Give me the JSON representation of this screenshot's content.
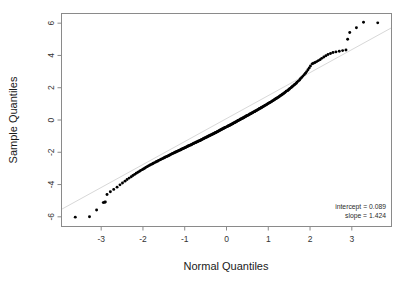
{
  "chart_data": {
    "type": "scatter",
    "title": "",
    "xlabel": "Normal Quantiles",
    "ylabel": "Sample Quantiles",
    "xlim": [
      -3.95,
      3.95
    ],
    "ylim": [
      -6.6,
      6.6
    ],
    "xticks": [
      -3,
      -2,
      -1,
      0,
      1,
      2,
      3
    ],
    "xtick_labels": [
      "-3",
      "-2",
      "-1",
      "0",
      "1",
      "2",
      "3"
    ],
    "yticks": [
      -6,
      -4,
      -2,
      0,
      2,
      4,
      6
    ],
    "ytick_labels": [
      "-6",
      "-4",
      "-2",
      "0",
      "2",
      "4",
      "6"
    ],
    "grid": false,
    "legend": "none",
    "point_color": "#000000",
    "reference_line": {
      "label": "qq reference line",
      "color": "#d8d8d8",
      "intercept": 0.089,
      "slope": 1.424
    },
    "annotations": [
      "intercept = 0.089",
      "slope = 1.424"
    ],
    "x": [
      -3.62,
      -3.28,
      -3.11,
      -2.95,
      -2.92,
      -2.9,
      -2.86,
      -2.78,
      -2.7,
      -2.62,
      -2.55,
      -2.49,
      -2.43,
      -2.38,
      -2.33,
      -2.28,
      -2.24,
      -2.2,
      -2.16,
      -2.12,
      -2.08,
      -2.05,
      -2.01,
      -1.98,
      -1.95,
      -1.92,
      -1.89,
      -1.86,
      -1.83,
      -1.8,
      -1.77,
      -1.75,
      -1.72,
      -1.69,
      -1.67,
      -1.64,
      -1.62,
      -1.59,
      -1.57,
      -1.55,
      -1.52,
      -1.5,
      -1.48,
      -1.46,
      -1.43,
      -1.41,
      -1.39,
      -1.37,
      -1.35,
      -1.33,
      -1.31,
      -1.29,
      -1.27,
      -1.25,
      -1.23,
      -1.21,
      -1.19,
      -1.17,
      -1.15,
      -1.13,
      -1.11,
      -1.09,
      -1.08,
      -1.06,
      -1.04,
      -1.02,
      -1.0,
      -0.98,
      -0.97,
      -0.95,
      -0.93,
      -0.91,
      -0.9,
      -0.88,
      -0.86,
      -0.84,
      -0.83,
      -0.81,
      -0.79,
      -0.78,
      -0.76,
      -0.74,
      -0.73,
      -0.71,
      -0.69,
      -0.68,
      -0.66,
      -0.64,
      -0.63,
      -0.61,
      -0.6,
      -0.58,
      -0.56,
      -0.55,
      -0.53,
      -0.52,
      -0.5,
      -0.48,
      -0.47,
      -0.45,
      -0.44,
      -0.42,
      -0.41,
      -0.39,
      -0.38,
      -0.36,
      -0.34,
      -0.33,
      -0.31,
      -0.3,
      -0.28,
      -0.27,
      -0.25,
      -0.24,
      -0.22,
      -0.21,
      -0.19,
      -0.18,
      -0.16,
      -0.15,
      -0.13,
      -0.12,
      -0.1,
      -0.09,
      -0.07,
      -0.06,
      -0.04,
      -0.03,
      -0.01,
      0.01,
      0.03,
      0.04,
      0.06,
      0.07,
      0.09,
      0.1,
      0.12,
      0.13,
      0.15,
      0.16,
      0.18,
      0.19,
      0.21,
      0.22,
      0.24,
      0.25,
      0.27,
      0.28,
      0.3,
      0.31,
      0.33,
      0.34,
      0.36,
      0.38,
      0.39,
      0.41,
      0.42,
      0.44,
      0.45,
      0.47,
      0.48,
      0.5,
      0.52,
      0.53,
      0.55,
      0.56,
      0.58,
      0.6,
      0.61,
      0.63,
      0.64,
      0.66,
      0.68,
      0.69,
      0.71,
      0.73,
      0.74,
      0.76,
      0.78,
      0.79,
      0.81,
      0.83,
      0.84,
      0.86,
      0.88,
      0.9,
      0.91,
      0.93,
      0.95,
      0.97,
      0.98,
      1.0,
      1.02,
      1.04,
      1.06,
      1.08,
      1.09,
      1.11,
      1.13,
      1.15,
      1.17,
      1.19,
      1.21,
      1.23,
      1.25,
      1.27,
      1.29,
      1.31,
      1.33,
      1.35,
      1.37,
      1.39,
      1.41,
      1.43,
      1.46,
      1.48,
      1.5,
      1.52,
      1.55,
      1.57,
      1.59,
      1.62,
      1.64,
      1.67,
      1.69,
      1.72,
      1.75,
      1.77,
      1.8,
      1.83,
      1.86,
      1.89,
      1.92,
      1.95,
      1.98,
      2.01,
      2.05,
      2.08,
      2.12,
      2.16,
      2.2,
      2.24,
      2.28,
      2.33,
      2.38,
      2.43,
      2.49,
      2.55,
      2.62,
      2.7,
      2.78,
      2.86,
      2.9,
      2.95,
      3.11,
      3.28,
      3.62
    ],
    "y": [
      -6.02,
      -6.0,
      -5.58,
      -5.12,
      -5.1,
      -5.08,
      -4.62,
      -4.45,
      -4.3,
      -4.16,
      -4.02,
      -3.9,
      -3.79,
      -3.69,
      -3.6,
      -3.52,
      -3.44,
      -3.37,
      -3.3,
      -3.24,
      -3.18,
      -3.12,
      -3.07,
      -3.02,
      -2.97,
      -2.92,
      -2.88,
      -2.83,
      -2.79,
      -2.75,
      -2.71,
      -2.68,
      -2.64,
      -2.6,
      -2.57,
      -2.54,
      -2.5,
      -2.47,
      -2.44,
      -2.41,
      -2.38,
      -2.35,
      -2.32,
      -2.29,
      -2.26,
      -2.24,
      -2.21,
      -2.18,
      -2.16,
      -2.13,
      -2.1,
      -2.08,
      -2.05,
      -2.03,
      -2.0,
      -1.98,
      -1.95,
      -1.93,
      -1.91,
      -1.88,
      -1.86,
      -1.84,
      -1.81,
      -1.79,
      -1.77,
      -1.75,
      -1.72,
      -1.7,
      -1.68,
      -1.66,
      -1.63,
      -1.61,
      -1.59,
      -1.57,
      -1.55,
      -1.53,
      -1.51,
      -1.48,
      -1.46,
      -1.44,
      -1.42,
      -1.4,
      -1.38,
      -1.36,
      -1.34,
      -1.32,
      -1.3,
      -1.28,
      -1.26,
      -1.24,
      -1.22,
      -1.2,
      -1.17,
      -1.15,
      -1.13,
      -1.11,
      -1.09,
      -1.07,
      -1.05,
      -1.03,
      -1.01,
      -0.99,
      -0.97,
      -0.95,
      -0.93,
      -0.91,
      -0.89,
      -0.87,
      -0.85,
      -0.83,
      -0.81,
      -0.79,
      -0.77,
      -0.75,
      -0.73,
      -0.71,
      -0.69,
      -0.66,
      -0.64,
      -0.62,
      -0.6,
      -0.58,
      -0.56,
      -0.54,
      -0.52,
      -0.5,
      -0.48,
      -0.46,
      -0.44,
      -0.41,
      -0.39,
      -0.37,
      -0.35,
      -0.33,
      -0.31,
      -0.29,
      -0.27,
      -0.25,
      -0.23,
      -0.2,
      -0.18,
      -0.16,
      -0.14,
      -0.12,
      -0.1,
      -0.08,
      -0.05,
      -0.03,
      -0.01,
      0.01,
      0.03,
      0.06,
      0.08,
      0.1,
      0.12,
      0.14,
      0.17,
      0.19,
      0.21,
      0.23,
      0.26,
      0.28,
      0.3,
      0.32,
      0.35,
      0.37,
      0.39,
      0.42,
      0.44,
      0.46,
      0.49,
      0.51,
      0.53,
      0.56,
      0.58,
      0.61,
      0.63,
      0.66,
      0.68,
      0.71,
      0.73,
      0.76,
      0.78,
      0.81,
      0.84,
      0.86,
      0.89,
      0.92,
      0.94,
      0.97,
      1.0,
      1.03,
      1.06,
      1.08,
      1.11,
      1.14,
      1.17,
      1.2,
      1.23,
      1.27,
      1.3,
      1.33,
      1.36,
      1.4,
      1.43,
      1.47,
      1.5,
      1.54,
      1.58,
      1.61,
      1.65,
      1.69,
      1.73,
      1.78,
      1.82,
      1.86,
      1.91,
      1.96,
      2.01,
      2.06,
      2.11,
      2.17,
      2.22,
      2.28,
      2.35,
      2.41,
      2.48,
      2.56,
      2.63,
      2.72,
      2.81,
      2.9,
      3.0,
      3.11,
      3.23,
      3.35,
      3.48,
      3.52,
      3.56,
      3.62,
      3.68,
      3.74,
      3.82,
      3.9,
      3.98,
      4.06,
      4.12,
      4.18,
      4.22,
      4.26,
      4.3,
      4.34,
      5.0,
      5.42,
      5.72,
      6.06,
      6.02
    ]
  }
}
